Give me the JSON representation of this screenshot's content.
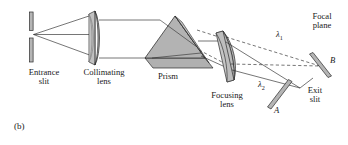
{
  "figure": {
    "panel_label": "(b)",
    "caption_type": "optical-spectrometer-schematic"
  },
  "colors": {
    "stroke": "#2b2b2b",
    "glass_fill": "#b8b8b8",
    "glass_fill_light": "#cfcfcf",
    "glass_fill_dark": "#a0a0a0",
    "prism_face": "#b3b3b3",
    "prism_top": "#c9c9c9",
    "prism_base": "#b0b0b0",
    "background": "#ffffff",
    "text": "#1a1a1a"
  },
  "components": [
    {
      "id": "entrance-slit",
      "label": "Entrance\nslit",
      "x": 44,
      "y": 74
    },
    {
      "id": "collimating-lens",
      "label": "Collimating\nlens",
      "x": 104,
      "y": 74
    },
    {
      "id": "prism",
      "label": "Prism",
      "x": 168,
      "y": 74
    },
    {
      "id": "focusing-lens",
      "label": "Focusing\nlens",
      "x": 228,
      "y": 94
    },
    {
      "id": "exit-slit",
      "label": "Exit\nslit",
      "x": 314,
      "y": 92
    },
    {
      "id": "focal-plane",
      "label": "Focal\nplane",
      "x": 320,
      "y": 16
    }
  ],
  "ray_labels": [
    {
      "id": "lambda-1",
      "text": "λ",
      "subscript": "1",
      "x": 281,
      "y": 33
    },
    {
      "id": "lambda-2",
      "text": "λ",
      "subscript": "2",
      "x": 262,
      "y": 83
    }
  ],
  "point_labels": [
    {
      "id": "point-B",
      "text": "B",
      "x": 331,
      "y": 61
    },
    {
      "id": "point-A",
      "text": "A",
      "x": 277,
      "y": 110
    }
  ],
  "optics": {
    "entrance_slit": {
      "x": 31,
      "gap_top": 30,
      "gap_bottom": 38,
      "top": 12,
      "bottom": 62
    },
    "collimating_lens": {
      "cx": 97,
      "cy": 38,
      "half_height": 26,
      "half_width": 6
    },
    "prism_apex": {
      "x": 175,
      "y": 16
    },
    "focusing_lens": {
      "cx": 226,
      "cy": 56
    },
    "focal_plane_bar_upper": {
      "x1": 311,
      "y1": 55,
      "x2": 330,
      "y2": 78
    },
    "focal_plane_bar_lower": {
      "x1": 269,
      "y1": 108,
      "x2": 292,
      "y2": 80
    }
  }
}
